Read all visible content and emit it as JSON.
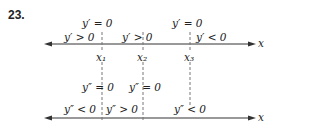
{
  "problem_number": "23.",
  "top_axis": {
    "axis_label": "x",
    "critical_labels": [
      "y′ = 0",
      "y′ = 0"
    ],
    "sign_labels": [
      "y′ > 0",
      "y′ > 0",
      "y′ < 0"
    ],
    "points": [
      "x₁",
      "x₂",
      "x₃"
    ]
  },
  "bottom_axis": {
    "axis_label": "x",
    "inflection_labels": [
      "y″ = 0",
      "y″ = 0"
    ],
    "sign_labels": [
      "y″ < 0",
      "y″ > 0",
      "y″ < 0"
    ]
  },
  "colors": {
    "line": "#333333",
    "dash": "#777777"
  }
}
